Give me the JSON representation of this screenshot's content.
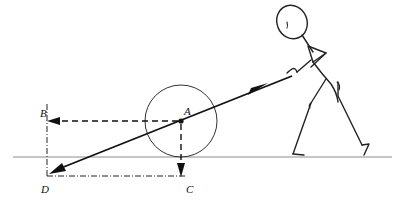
{
  "figure": {
    "stroke_color": "#1a1a1a",
    "ground_color": "#8c8c8c",
    "background": "#ffffff",
    "width": 405,
    "height": 205
  },
  "labels": {
    "A": "A",
    "B": "B",
    "C": "C",
    "D": "D"
  },
  "points": {
    "A": {
      "x": 181,
      "y": 121,
      "role": "wheel-center"
    },
    "B": {
      "x": 47,
      "y": 121,
      "role": "horizontal-projection"
    },
    "C": {
      "x": 181,
      "y": 176,
      "role": "below-contact-point"
    },
    "D": {
      "x": 47,
      "y": 176,
      "role": "origin-corner"
    }
  },
  "geometry": {
    "wheel": {
      "cx": 181,
      "cy": 121,
      "r": 36
    },
    "ground_line": {
      "x1": 13,
      "y1": 157,
      "x2": 392,
      "y2": 157
    },
    "rod": {
      "x1": 52,
      "y1": 172,
      "x2": 292,
      "y2": 76
    },
    "rod_arrow_at": {
      "x": 262,
      "y": 88,
      "direction": "up-right"
    },
    "vector_BA": {
      "from": "B",
      "to": "A",
      "style": "dashed",
      "arrow_at": "B",
      "direction": "right"
    },
    "vector_CA": {
      "from": "C",
      "to": "A",
      "style": "dashed",
      "arrow_at": "C",
      "direction": "down"
    },
    "vector_DA": {
      "from": "A",
      "to": "D",
      "style": "solid",
      "arrow_at": "D",
      "direction": "down-left"
    },
    "axis_BD": {
      "style": "dash-dot",
      "orientation": "vertical"
    },
    "axis_DC": {
      "style": "dash-dot",
      "orientation": "horizontal"
    }
  },
  "person": {
    "name": "stick-figure-pulling",
    "head": {
      "cx": 292,
      "cy": 22,
      "rx": 15,
      "ry": 17,
      "rotation": -20
    },
    "hand_grip": {
      "x": 292,
      "y": 76
    },
    "feet": [
      {
        "x": 293,
        "y": 156
      },
      {
        "x": 360,
        "y": 156
      }
    ]
  }
}
